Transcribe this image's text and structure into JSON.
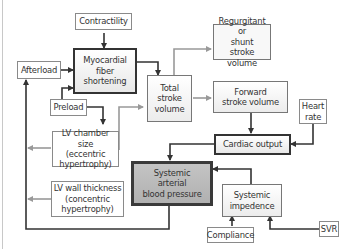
{
  "diagram": {
    "nodes": {
      "contractility": "Contractility",
      "myocardial": "Myocardial\nfiber\nshortening",
      "afterload": "Afterload",
      "preload": "Preload",
      "total_sv": "Total\nstroke\nvolume",
      "regurgitant": "Regurgitant or\nshunt\nstroke volume",
      "forward_sv": "Forward\nstroke volume",
      "heart_rate": "Heart\nrate",
      "cardiac_output": "Cardiac output",
      "lv_chamber": "LV chamber size\n(eccentric\nhypertrophy)",
      "lv_wall": "LV wall thickness\n(concentric\nhypertrophy)",
      "sabp": "Systemic\narterial\nblood pressure",
      "impedence": "Systemic\nimpedence",
      "compliance": "Compliance",
      "svr": "SVR"
    },
    "edges": [
      {
        "from": "Contractility",
        "to": "Myocardial fiber shortening"
      },
      {
        "from": "Afterload",
        "to": "Myocardial fiber shortening"
      },
      {
        "from": "Preload",
        "to": "Myocardial fiber shortening"
      },
      {
        "from": "Preload",
        "to": "LV chamber size"
      },
      {
        "from": "Myocardial fiber shortening",
        "to": "Total stroke volume"
      },
      {
        "from": "LV chamber size",
        "to": "Total stroke volume",
        "style": "gray"
      },
      {
        "from": "Total stroke volume",
        "to": "Regurgitant or shunt stroke volume",
        "style": "gray"
      },
      {
        "from": "Total stroke volume",
        "to": "Forward stroke volume",
        "style": "gray"
      },
      {
        "from": "Forward stroke volume",
        "to": "Cardiac output"
      },
      {
        "from": "Heart rate",
        "to": "Cardiac output"
      },
      {
        "from": "Cardiac output",
        "to": "Systemic arterial blood pressure"
      },
      {
        "from": "Systemic impedence",
        "to": "Systemic arterial blood pressure"
      },
      {
        "from": "Compliance",
        "to": "Systemic impedence"
      },
      {
        "from": "SVR",
        "to": "Systemic impedence"
      },
      {
        "from": "Systemic arterial blood pressure",
        "to": "Afterload"
      },
      {
        "from": "LV chamber size",
        "to": "Afterload loop",
        "style": "gray"
      },
      {
        "from": "LV wall thickness",
        "to": "Afterload loop",
        "style": "gray"
      }
    ]
  }
}
